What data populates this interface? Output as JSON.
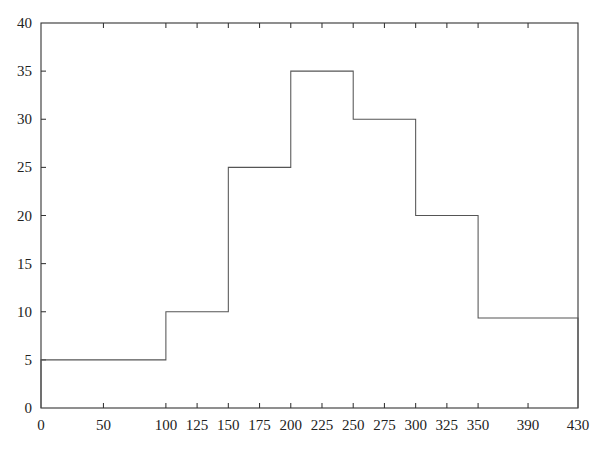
{
  "chart_data": {
    "type": "bar",
    "title": "",
    "subtitle": "",
    "xlabel": "",
    "ylabel": "",
    "xlim": [
      0,
      430
    ],
    "ylim": [
      0,
      40
    ],
    "grid": false,
    "legend": null,
    "annotations": [],
    "bin_edges": [
      0,
      100,
      150,
      200,
      250,
      300,
      350,
      430
    ],
    "categories": [
      "0-100",
      "100-150",
      "150-200",
      "200-250",
      "250-300",
      "300-350",
      "350-430"
    ],
    "values": [
      5,
      10,
      25,
      35,
      30,
      20,
      9.35
    ],
    "bars": [
      {
        "label": "0-100",
        "start": 0,
        "end": 100,
        "value": 5
      },
      {
        "label": "100-150",
        "start": 100,
        "end": 150,
        "value": 10
      },
      {
        "label": "150-200",
        "start": 150,
        "end": 200,
        "value": 25
      },
      {
        "label": "200-250",
        "start": 200,
        "end": 250,
        "value": 35
      },
      {
        "label": "250-300",
        "start": 250,
        "end": 300,
        "value": 30
      },
      {
        "label": "300-350",
        "start": 300,
        "end": 350,
        "value": 20
      },
      {
        "label": "350-430",
        "start": 350,
        "end": 430,
        "value": 9.35
      }
    ],
    "xticks": [
      {
        "value": 0,
        "label": "0"
      },
      {
        "value": 50,
        "label": "50"
      },
      {
        "value": 100,
        "label": "100"
      },
      {
        "value": 125,
        "label": "125"
      },
      {
        "value": 150,
        "label": "150"
      },
      {
        "value": 175,
        "label": "175"
      },
      {
        "value": 200,
        "label": "200"
      },
      {
        "value": 225,
        "label": "225"
      },
      {
        "value": 250,
        "label": "250"
      },
      {
        "value": 275,
        "label": "275"
      },
      {
        "value": 300,
        "label": "300"
      },
      {
        "value": 325,
        "label": "325"
      },
      {
        "value": 350,
        "label": "350"
      },
      {
        "value": 390,
        "label": "390"
      },
      {
        "value": 430,
        "label": "430"
      }
    ],
    "yticks": [
      {
        "value": 0,
        "label": "0"
      },
      {
        "value": 5,
        "label": "5"
      },
      {
        "value": 10,
        "label": "10"
      },
      {
        "value": 15,
        "label": "15"
      },
      {
        "value": 20,
        "label": "20"
      },
      {
        "value": 25,
        "label": "25"
      },
      {
        "value": 30,
        "label": "30"
      },
      {
        "value": 35,
        "label": "35"
      },
      {
        "value": 40,
        "label": "40"
      }
    ],
    "colors": {
      "axis": "#333333",
      "bar_stroke": "#555555",
      "bar_fill": "none",
      "background": "#ffffff",
      "text": "#222222"
    },
    "plot_area": {
      "left": 41,
      "right": 578,
      "top": 23,
      "bottom": 408
    }
  }
}
